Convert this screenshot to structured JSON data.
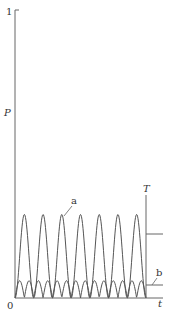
{
  "chart_data": {
    "type": "line",
    "title": "",
    "xlabel": "t",
    "ylabel": "P",
    "ylim": [
      0,
      1
    ],
    "yticks": [
      "0",
      "1"
    ],
    "grid": false,
    "legend": "none",
    "annotations": [
      {
        "label": "a",
        "target": "large periodic pulses"
      },
      {
        "label": "b",
        "target": "small periodic humps (time-average level)"
      },
      {
        "label": "T",
        "target": "vertical marker at end of time range, with step to average level of a"
      }
    ],
    "series": [
      {
        "name": "a",
        "description": "periodic sin^2-like pulses",
        "peak": 0.29,
        "period_count": 7,
        "peak_t": [
          0.07,
          0.2,
          0.34,
          0.47,
          0.61,
          0.75,
          0.89
        ],
        "mean_level": 0.22
      },
      {
        "name": "b",
        "description": "small double-frequency humps",
        "peak": 0.06,
        "mean_level": 0.045
      }
    ],
    "colors": {
      "line": "#555555",
      "text": "#333333"
    }
  },
  "labels": {
    "y_axis": "P",
    "x_axis": "t",
    "y_top": "1",
    "origin": "0",
    "curve_a": "a",
    "curve_b": "b",
    "marker_T": "T"
  }
}
